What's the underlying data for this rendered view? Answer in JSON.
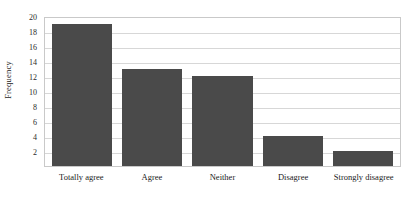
{
  "chart_data": {
    "type": "bar",
    "title": "",
    "subtitle": "",
    "xlabel": "",
    "ylabel": "Frequency",
    "categories": [
      "Totally agree",
      "Agree",
      "Neither",
      "Disagree",
      "Strongly disagree"
    ],
    "values": [
      19,
      13,
      12,
      4,
      2
    ],
    "ylim": [
      0,
      20
    ],
    "yticks": [
      2,
      4,
      6,
      8,
      10,
      12,
      14,
      16,
      18,
      20
    ],
    "ytick_labels": [
      "2",
      "4",
      "6",
      "8",
      "10",
      "12",
      "14",
      "16",
      "18",
      "20"
    ],
    "grid": "horizontal",
    "legend": "none",
    "bar_color": "#4a4a4a",
    "gridline_color": "#d7d7d7",
    "plot_border_color": "#c9c9c9",
    "background_color": "#ffffff",
    "annotations": []
  }
}
